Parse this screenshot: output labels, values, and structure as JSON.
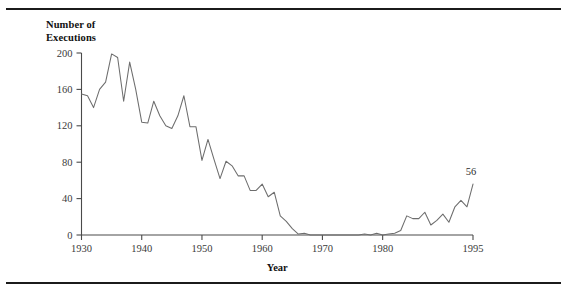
{
  "figure": {
    "y_axis_title_line1": "Number of",
    "y_axis_title_line2": "Executions",
    "x_axis_title": "Year",
    "endpoint_label": "56",
    "line_color": "#6d6d6d",
    "axis_color": "#4a4a4a",
    "rule_color": "#1b1b1b",
    "background_color": "#ffffff"
  },
  "chart_data": {
    "type": "line",
    "title": "",
    "subtitle": "",
    "xlabel": "Year",
    "ylabel": "Number of Executions",
    "xlim": [
      1930,
      1995
    ],
    "ylim": [
      0,
      200
    ],
    "grid": false,
    "legend": "none",
    "xticks": [
      1930,
      1940,
      1950,
      1960,
      1970,
      1980,
      1995
    ],
    "xticklabels": [
      "1930",
      "1940",
      "1950",
      "1960",
      "1970",
      "1980",
      "1995"
    ],
    "yticks": [
      0,
      40,
      80,
      120,
      160,
      200
    ],
    "yticklabels": [
      "0",
      "40",
      "80",
      "120",
      "160",
      "200"
    ],
    "annotations": [
      {
        "x": 1995,
        "y": 56,
        "text": "56"
      }
    ],
    "series": [
      {
        "name": "Executions",
        "x": [
          1930,
          1931,
          1932,
          1933,
          1934,
          1935,
          1936,
          1937,
          1938,
          1939,
          1940,
          1941,
          1942,
          1943,
          1944,
          1945,
          1946,
          1947,
          1948,
          1949,
          1950,
          1951,
          1952,
          1953,
          1954,
          1955,
          1956,
          1957,
          1958,
          1959,
          1960,
          1961,
          1962,
          1963,
          1964,
          1965,
          1966,
          1967,
          1968,
          1969,
          1970,
          1971,
          1972,
          1973,
          1974,
          1975,
          1976,
          1977,
          1978,
          1979,
          1980,
          1981,
          1982,
          1983,
          1984,
          1985,
          1986,
          1987,
          1988,
          1989,
          1990,
          1991,
          1992,
          1993,
          1994,
          1995
        ],
        "values": [
          155,
          153,
          140,
          160,
          168,
          199,
          195,
          147,
          190,
          160,
          124,
          123,
          147,
          131,
          120,
          117,
          131,
          153,
          119,
          119,
          82,
          105,
          83,
          62,
          81,
          76,
          65,
          65,
          49,
          49,
          56,
          42,
          47,
          21,
          15,
          7,
          1,
          2,
          0,
          0,
          0,
          0,
          0,
          0,
          0,
          0,
          0,
          1,
          0,
          2,
          0,
          1,
          2,
          5,
          21,
          18,
          18,
          25,
          11,
          16,
          23,
          14,
          31,
          38,
          31,
          56
        ]
      }
    ]
  }
}
